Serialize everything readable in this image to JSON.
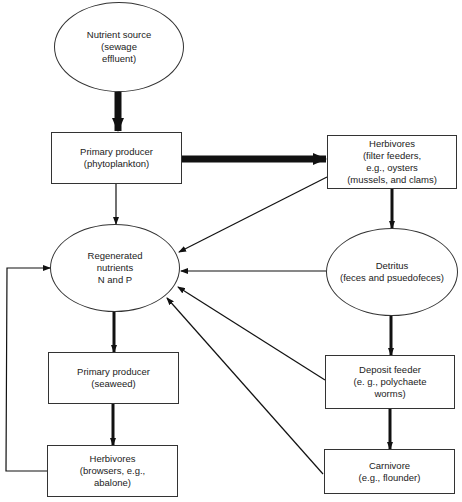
{
  "nodes": {
    "nutrient_source": {
      "lines": [
        "Nutrient source",
        "(sewage",
        "effluent)"
      ]
    },
    "phytoplankton": {
      "lines": [
        "Primary producer",
        "(phytoplankton)"
      ]
    },
    "filter_herbivores": {
      "lines": [
        "Herbivores",
        "(filter feeders,",
        "e.g., oysters",
        "(mussels, and clams)"
      ]
    },
    "regenerated": {
      "lines": [
        "Regenerated",
        "nutrients",
        "N and P"
      ]
    },
    "detritus": {
      "lines": [
        "Detritus",
        "(feces and psuedofeces)"
      ]
    },
    "seaweed": {
      "lines": [
        "Primary producer",
        "(seaweed)"
      ]
    },
    "deposit_feeder": {
      "lines": [
        "Deposit feeder",
        "(e. g., polychaete",
        "worms)"
      ]
    },
    "browsers": {
      "lines": [
        "Herbivores",
        "(browsers, e.g.,",
        "abalone)"
      ]
    },
    "carnivore": {
      "lines": [
        "Carnivore",
        "(e.g., flounder)"
      ]
    }
  },
  "colors": {
    "line": "#111111",
    "border": "#333333",
    "background": "#ffffff"
  }
}
